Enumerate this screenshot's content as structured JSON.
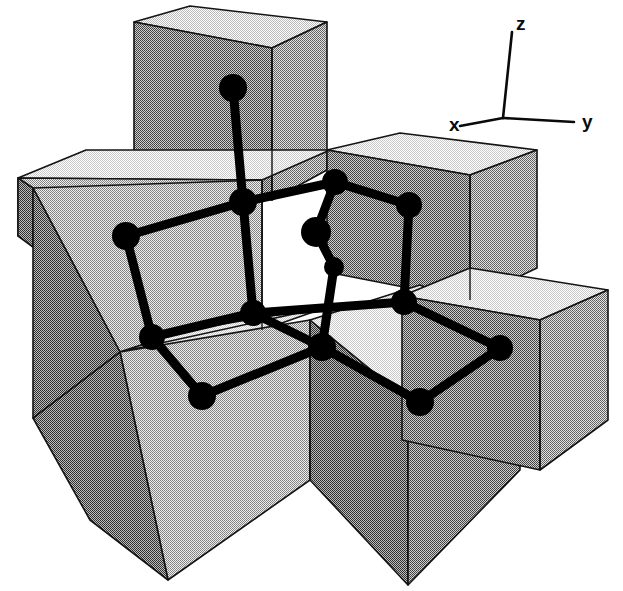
{
  "figure": {
    "kind": "crystal-lattice-diagram",
    "title": "",
    "background_color": "#ffffff",
    "ink_color": "#000000"
  },
  "axes_indicator": {
    "name": "coordinate-axes-triad",
    "origin": [
      503,
      118
    ],
    "labels": {
      "x": "x",
      "y": "y",
      "z": "z"
    },
    "endpoints": {
      "x": [
        460,
        126
      ],
      "y": [
        574,
        122
      ],
      "z": [
        512,
        32
      ]
    },
    "label_positions": {
      "x": [
        449,
        131
      ],
      "y": [
        582,
        128
      ],
      "z": [
        516,
        30
      ]
    }
  },
  "shading": {
    "top_face": "#d8d8d8",
    "top_face_bright": "#e4e4e4",
    "left_face": "#b0b0b0",
    "right_face": "#9a9a9a",
    "dark_face": "#7a7a7a",
    "darkest_face": "#6a6a6a",
    "edge_color": "#1a1a1a"
  },
  "blocks": [
    {
      "id": "tall-back-column",
      "shade": "right",
      "description": "tall vertical block rising at back center"
    },
    {
      "id": "left-slab",
      "shade": "left",
      "description": "wide low slab on the left"
    },
    {
      "id": "back-right-block",
      "shade": "right",
      "description": "mid-height block at back right"
    },
    {
      "id": "front-left-block",
      "shade": "left",
      "description": "front-left cube"
    },
    {
      "id": "front-right-block",
      "shade": "dark",
      "description": "front-right cube"
    },
    {
      "id": "right-low-slab",
      "shade": "right",
      "description": "low slab extending to the far right"
    }
  ],
  "lattice": {
    "atom_color": "#000000",
    "bond_color": "#000000",
    "atom_radius": 13,
    "bond_width": 9,
    "atom_count": 14,
    "bond_count": 18,
    "atoms": [
      {
        "id": "a-top-apex",
        "x": 233,
        "y": 88,
        "r": 14
      },
      {
        "id": "a-center-hub",
        "x": 243,
        "y": 202,
        "r": 14
      },
      {
        "id": "a-back-top",
        "x": 335,
        "y": 182,
        "r": 13
      },
      {
        "id": "a-right-top",
        "x": 409,
        "y": 205,
        "r": 13
      },
      {
        "id": "a-left-upper",
        "x": 126,
        "y": 236,
        "r": 14
      },
      {
        "id": "a-inner-upper",
        "x": 316,
        "y": 232,
        "r": 15
      },
      {
        "id": "a-inner-mid",
        "x": 334,
        "y": 267,
        "r": 10
      },
      {
        "id": "a-left-mid",
        "x": 152,
        "y": 337,
        "r": 13
      },
      {
        "id": "a-mid-hub",
        "x": 253,
        "y": 313,
        "r": 13
      },
      {
        "id": "a-right-mid",
        "x": 404,
        "y": 302,
        "r": 13
      },
      {
        "id": "a-front-center",
        "x": 322,
        "y": 347,
        "r": 14
      },
      {
        "id": "a-front-left",
        "x": 202,
        "y": 396,
        "r": 14
      },
      {
        "id": "a-front-right",
        "x": 420,
        "y": 402,
        "r": 14
      },
      {
        "id": "a-far-right",
        "x": 500,
        "y": 348,
        "r": 13
      }
    ],
    "bonds": [
      [
        "a-top-apex",
        "a-center-hub"
      ],
      [
        "a-center-hub",
        "a-left-upper"
      ],
      [
        "a-center-hub",
        "a-back-top"
      ],
      [
        "a-center-hub",
        "a-mid-hub"
      ],
      [
        "a-back-top",
        "a-right-top"
      ],
      [
        "a-back-top",
        "a-inner-upper"
      ],
      [
        "a-inner-upper",
        "a-inner-mid"
      ],
      [
        "a-inner-mid",
        "a-front-center"
      ],
      [
        "a-right-top",
        "a-right-mid"
      ],
      [
        "a-left-upper",
        "a-left-mid"
      ],
      [
        "a-left-mid",
        "a-mid-hub"
      ],
      [
        "a-left-mid",
        "a-front-left"
      ],
      [
        "a-mid-hub",
        "a-right-mid"
      ],
      [
        "a-mid-hub",
        "a-front-center"
      ],
      [
        "a-right-mid",
        "a-far-right"
      ],
      [
        "a-front-left",
        "a-front-center"
      ],
      [
        "a-front-center",
        "a-front-right"
      ],
      [
        "a-front-right",
        "a-far-right"
      ]
    ]
  }
}
